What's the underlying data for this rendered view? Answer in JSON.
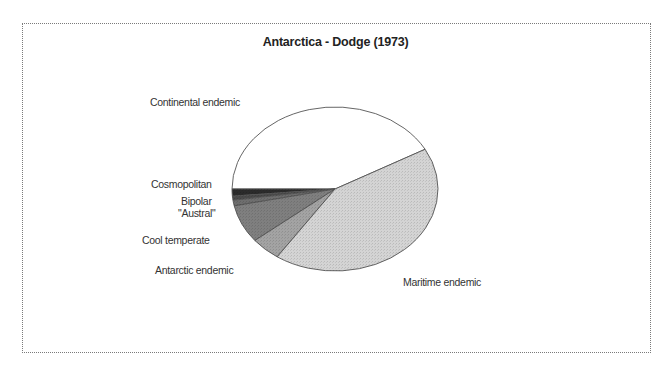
{
  "chart_data": {
    "type": "pie",
    "title": "Antarctica - Dodge (1973)",
    "categories": [
      "Continental endemic",
      "Cosmopolitan",
      "Bipolar",
      "\"Austral\"",
      "Cool  temperate",
      "Antarctic endemic",
      "Maritime endemic"
    ],
    "values": [
      41.9,
      1.4,
      0.8,
      1.1,
      7.5,
      4.7,
      42.5
    ],
    "unit": "percent of flora (estimated from slice angles)",
    "start_angle_deg": 29,
    "direction": "counterclockwise",
    "colors": [
      "#ffffff",
      "#2b2b2b",
      "#4a4a4a",
      "#6e6e6e",
      "#7f7f7f",
      "#a3a3a3",
      "#d4d4d4"
    ],
    "legend": "none (direct labels)",
    "xlabel": "",
    "ylabel": ""
  },
  "labels": {
    "continental": "Continental endemic",
    "cosmopolitan": "Cosmopolitan",
    "bipolar": "Bipolar",
    "austral": "\"Austral\"",
    "cool_temperate": "Cool  temperate",
    "antarctic": "Antarctic endemic",
    "maritime": "Maritime endemic"
  }
}
